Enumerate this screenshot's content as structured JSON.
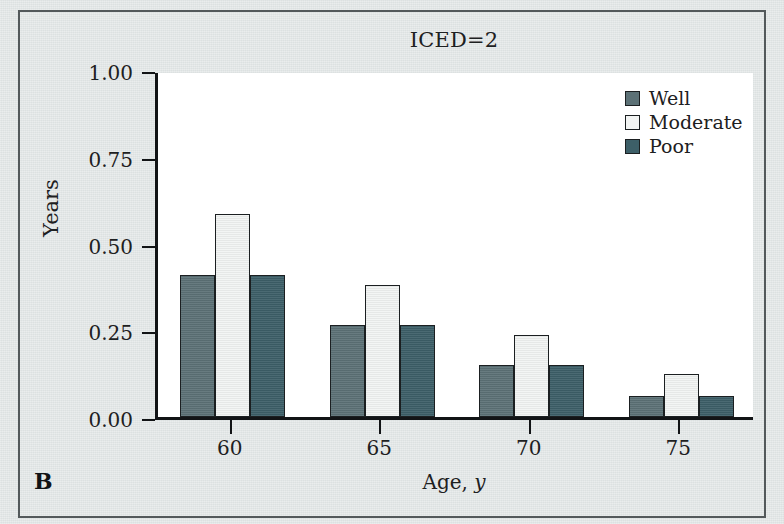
{
  "figure": {
    "panel_letter": "B",
    "background_color": "#dfe4e4",
    "frame_color": "#53595b",
    "plot_background": "#ffffff"
  },
  "chart_data": {
    "type": "bar",
    "title": "ICED=2",
    "xlabel": "Age, y",
    "xlabel_plain": "Age,",
    "xlabel_italic": "y",
    "ylabel": "Years",
    "categories": [
      "60",
      "65",
      "70",
      "75"
    ],
    "x": [
      60,
      65,
      70,
      75
    ],
    "series": [
      {
        "name": "Well",
        "color": "#5c7176",
        "values": [
          0.41,
          0.265,
          0.15,
          0.06
        ]
      },
      {
        "name": "Moderate",
        "color": "#f2f4f3",
        "values": [
          0.585,
          0.38,
          0.235,
          0.125
        ]
      },
      {
        "name": "Poor",
        "color": "#3d5f68",
        "values": [
          0.41,
          0.265,
          0.15,
          0.06
        ]
      }
    ],
    "ylim": [
      0.0,
      1.0
    ],
    "yticks": [
      0.0,
      0.25,
      0.5,
      0.75,
      1.0
    ],
    "ytick_labels": [
      "0.00",
      "0.25",
      "0.50",
      "0.75",
      "1.00"
    ],
    "xtick_labels": [
      "60",
      "65",
      "70",
      "75"
    ],
    "grid": false,
    "legend": {
      "position": "top-right",
      "entries": [
        {
          "label": "Well",
          "color": "#5c7176"
        },
        {
          "label": "Moderate",
          "color": "#f2f4f3"
        },
        {
          "label": "Poor",
          "color": "#3d5f68"
        }
      ]
    }
  }
}
